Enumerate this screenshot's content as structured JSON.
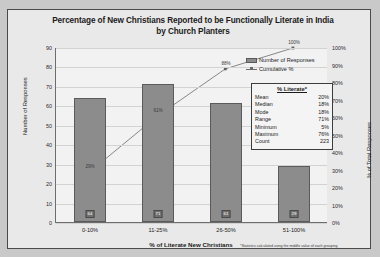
{
  "chart": {
    "title": "Percentage of New Christians Reported to be Functionally Literate in India by Church Planters",
    "footnote": "*Statistics calculated using the middle value of each grouping"
  },
  "legend": {
    "bars": "Number of Responses",
    "line": "Cumulative %"
  },
  "stats": {
    "title": "% Literate*",
    "rows": [
      {
        "label": "Mean",
        "value": "20%"
      },
      {
        "label": "Median",
        "value": "18%"
      },
      {
        "label": "Mode",
        "value": "18%"
      },
      {
        "label": "Range",
        "value": "71%"
      },
      {
        "label": "Minimum",
        "value": "5%"
      },
      {
        "label": "Maximum",
        "value": "76%"
      },
      {
        "label": "Count",
        "value": "223"
      }
    ]
  },
  "chart_data": {
    "type": "bar",
    "title": "Percentage of New Christians Reported to be Functionally Literate in India by Church Planters",
    "xlabel": "% of Literate New Christians",
    "ylabel": "Number of Responses",
    "y2label": "% of Total Responses",
    "categories": [
      "0-10%",
      "11-25%",
      "26-50%",
      "51-100%"
    ],
    "series": [
      {
        "name": "Number of Responses",
        "type": "bar",
        "values": [
          64,
          71,
          61,
          29
        ]
      },
      {
        "name": "Cumulative %",
        "type": "line",
        "values": [
          29,
          61,
          88,
          100
        ],
        "labels": [
          "29%",
          "61%",
          "88%",
          "100%"
        ]
      }
    ],
    "ylim": [
      0,
      90
    ],
    "ytick_labels": [
      "90",
      "80",
      "70",
      "60",
      "50",
      "40",
      "30",
      "20",
      "10",
      "0"
    ],
    "y2lim": [
      0,
      100
    ],
    "y2tick_labels": [
      "100%",
      "90%",
      "80%",
      "70%",
      "60%",
      "50%",
      "40%",
      "30%",
      "20%",
      "10%",
      "0%"
    ],
    "grid": true,
    "legend_position": "top-right"
  }
}
